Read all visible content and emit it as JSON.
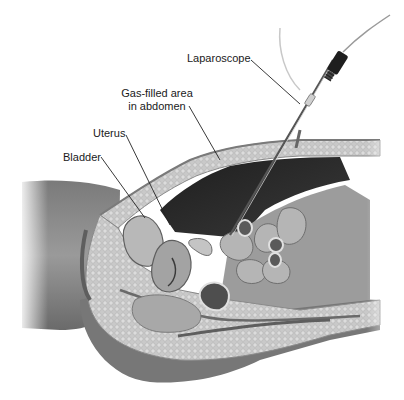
{
  "figure": {
    "labels": [
      {
        "id": "laparoscope",
        "text": "Laparoscope"
      },
      {
        "id": "gas",
        "lines": [
          "Gas-filled area",
          "in abdomen"
        ]
      },
      {
        "id": "uterus",
        "text": "Uterus"
      },
      {
        "id": "bladder",
        "text": "Bladder"
      }
    ],
    "colors": {
      "background": "#ffffff",
      "skin": "#8a8a8a",
      "skin_dark": "#5e5e5e",
      "fat": "#c8c8c8",
      "cavity": "#2b2b2b",
      "organ": "#a9a9a9",
      "label_text": "#1a1a1a",
      "leader_line": "#222222"
    }
  }
}
